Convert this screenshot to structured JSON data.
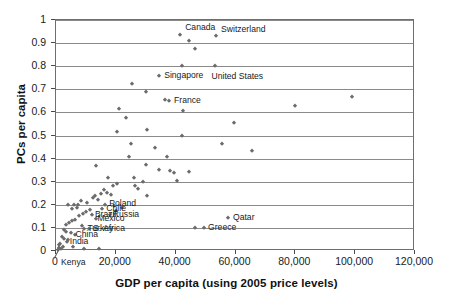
{
  "chart_data": {
    "type": "scatter",
    "title": "",
    "xlabel": "GDP per capita (using 2005 price levels)",
    "ylabel": "PCs per capita",
    "xlim": [
      0,
      120000
    ],
    "ylim": [
      0,
      1
    ],
    "xticks": [
      0,
      20000,
      40000,
      60000,
      80000,
      100000,
      120000
    ],
    "xtick_labels": [
      "0",
      "20,000",
      "40,000",
      "60,000",
      "80,000",
      "100,000",
      "120,000"
    ],
    "yticks": [
      0,
      0.1,
      0.2,
      0.3,
      0.4,
      0.5,
      0.6,
      0.7,
      0.8,
      0.9,
      1
    ],
    "ytick_labels": [
      "0",
      "0.1",
      "0.2",
      "0.3",
      "0.4",
      "0.5",
      "0.6",
      "0.7",
      "0.8",
      "0.9",
      "1"
    ],
    "grid": "horizontal",
    "legend": "none",
    "marker": "diamond",
    "marker_color": "#6b6b6b",
    "points": [
      {
        "x": 41500,
        "y": 0.935,
        "label": "Canada",
        "label_dx": 6,
        "label_dy": -7
      },
      {
        "x": 44500,
        "y": 0.91,
        "label": "",
        "label_dx": 0,
        "label_dy": 0
      },
      {
        "x": 53500,
        "y": 0.93,
        "label": "Switzerland",
        "label_dx": 6,
        "label_dy": -6
      },
      {
        "x": 46500,
        "y": 0.876,
        "label": "",
        "label_dx": 0,
        "label_dy": 0
      },
      {
        "x": 42000,
        "y": 0.8,
        "label": "",
        "label_dx": 0,
        "label_dy": 0
      },
      {
        "x": 53000,
        "y": 0.803,
        "label": "United States",
        "label_dx": -2,
        "label_dy": 7
      },
      {
        "x": 34500,
        "y": 0.757,
        "label": "Singapore",
        "label_dx": 6,
        "label_dy": 0
      },
      {
        "x": 25500,
        "y": 0.722,
        "label": "",
        "label_dx": 0,
        "label_dy": 0
      },
      {
        "x": 30000,
        "y": 0.688,
        "label": "",
        "label_dx": 0,
        "label_dy": 0
      },
      {
        "x": 36500,
        "y": 0.655,
        "label": "",
        "label_dx": 0,
        "label_dy": 0
      },
      {
        "x": 37800,
        "y": 0.648,
        "label": "France",
        "label_dx": 6,
        "label_dy": 0
      },
      {
        "x": 42500,
        "y": 0.605,
        "label": "",
        "label_dx": 0,
        "label_dy": 0
      },
      {
        "x": 21000,
        "y": 0.614,
        "label": "",
        "label_dx": 0,
        "label_dy": 0
      },
      {
        "x": 23500,
        "y": 0.577,
        "label": "",
        "label_dx": 0,
        "label_dy": 0
      },
      {
        "x": 59500,
        "y": 0.553,
        "label": "",
        "label_dx": 0,
        "label_dy": 0
      },
      {
        "x": 20500,
        "y": 0.515,
        "label": "",
        "label_dx": 0,
        "label_dy": 0
      },
      {
        "x": 30500,
        "y": 0.522,
        "label": "",
        "label_dx": 0,
        "label_dy": 0
      },
      {
        "x": 42000,
        "y": 0.498,
        "label": "",
        "label_dx": 0,
        "label_dy": 0
      },
      {
        "x": 80000,
        "y": 0.628,
        "label": "",
        "label_dx": 0,
        "label_dy": 0
      },
      {
        "x": 99000,
        "y": 0.665,
        "label": "",
        "label_dx": 0,
        "label_dy": 0
      },
      {
        "x": 25000,
        "y": 0.465,
        "label": "",
        "label_dx": 0,
        "label_dy": 0
      },
      {
        "x": 33000,
        "y": 0.448,
        "label": "",
        "label_dx": 0,
        "label_dy": 0
      },
      {
        "x": 55500,
        "y": 0.462,
        "label": "",
        "label_dx": 0,
        "label_dy": 0
      },
      {
        "x": 65500,
        "y": 0.432,
        "label": "",
        "label_dx": 0,
        "label_dy": 0
      },
      {
        "x": 24500,
        "y": 0.408,
        "label": "",
        "label_dx": 0,
        "label_dy": 0
      },
      {
        "x": 37000,
        "y": 0.408,
        "label": "",
        "label_dx": 0,
        "label_dy": 0
      },
      {
        "x": 30000,
        "y": 0.372,
        "label": "",
        "label_dx": 0,
        "label_dy": 0
      },
      {
        "x": 13500,
        "y": 0.368,
        "label": "",
        "label_dx": 0,
        "label_dy": 0
      },
      {
        "x": 34500,
        "y": 0.352,
        "label": "",
        "label_dx": 0,
        "label_dy": 0
      },
      {
        "x": 38000,
        "y": 0.345,
        "label": "",
        "label_dx": 0,
        "label_dy": 0
      },
      {
        "x": 39500,
        "y": 0.338,
        "label": "",
        "label_dx": 0,
        "label_dy": 0
      },
      {
        "x": 44500,
        "y": 0.343,
        "label": "",
        "label_dx": 0,
        "label_dy": 0
      },
      {
        "x": 40500,
        "y": 0.302,
        "label": "",
        "label_dx": 0,
        "label_dy": 0
      },
      {
        "x": 17500,
        "y": 0.318,
        "label": "",
        "label_dx": 0,
        "label_dy": 0
      },
      {
        "x": 29000,
        "y": 0.298,
        "label": "",
        "label_dx": 0,
        "label_dy": 0
      },
      {
        "x": 26500,
        "y": 0.282,
        "label": "",
        "label_dx": 0,
        "label_dy": 0
      },
      {
        "x": 27500,
        "y": 0.268,
        "label": "",
        "label_dx": 0,
        "label_dy": 0
      },
      {
        "x": 16000,
        "y": 0.262,
        "label": "",
        "label_dx": 0,
        "label_dy": 0
      },
      {
        "x": 17000,
        "y": 0.252,
        "label": "",
        "label_dx": 0,
        "label_dy": 0
      },
      {
        "x": 15000,
        "y": 0.248,
        "label": "",
        "label_dx": 0,
        "label_dy": 0
      },
      {
        "x": 18500,
        "y": 0.242,
        "label": "",
        "label_dx": 0,
        "label_dy": 0
      },
      {
        "x": 13000,
        "y": 0.238,
        "label": "",
        "label_dx": 0,
        "label_dy": 0
      },
      {
        "x": 30500,
        "y": 0.238,
        "label": "",
        "label_dx": 0,
        "label_dy": 0
      },
      {
        "x": 12500,
        "y": 0.228,
        "label": "",
        "label_dx": 0,
        "label_dy": 0
      },
      {
        "x": 14000,
        "y": 0.222,
        "label": "",
        "label_dx": 0,
        "label_dy": 0
      },
      {
        "x": 8500,
        "y": 0.215,
        "label": "",
        "label_dx": 0,
        "label_dy": 0
      },
      {
        "x": 10500,
        "y": 0.208,
        "label": "",
        "label_dx": 0,
        "label_dy": 0
      },
      {
        "x": 4000,
        "y": 0.2,
        "label": "",
        "label_dx": 0,
        "label_dy": 0
      },
      {
        "x": 6000,
        "y": 0.199,
        "label": "",
        "label_dx": 0,
        "label_dy": 0
      },
      {
        "x": 7500,
        "y": 0.197,
        "label": "",
        "label_dx": 0,
        "label_dy": 0
      },
      {
        "x": 16500,
        "y": 0.2,
        "label": "Poland",
        "label_dx": 5,
        "label_dy": -1
      },
      {
        "x": 19500,
        "y": 0.196,
        "label": "",
        "label_dx": 0,
        "label_dy": 0
      },
      {
        "x": 15500,
        "y": 0.182,
        "label": "Chile",
        "label_dx": 5,
        "label_dy": 0
      },
      {
        "x": 11500,
        "y": 0.178,
        "label": "",
        "label_dx": 0,
        "label_dy": 0
      },
      {
        "x": 10000,
        "y": 0.17,
        "label": "",
        "label_dx": 0,
        "label_dy": 0
      },
      {
        "x": 9000,
        "y": 0.162,
        "label": "",
        "label_dx": 0,
        "label_dy": 0
      },
      {
        "x": 12000,
        "y": 0.158,
        "label": "Brazil",
        "label_dx": 4,
        "label_dy": 0
      },
      {
        "x": 18000,
        "y": 0.156,
        "label": "Russia",
        "label_dx": 4,
        "label_dy": 0
      },
      {
        "x": 7800,
        "y": 0.15,
        "label": "",
        "label_dx": 0,
        "label_dy": 0
      },
      {
        "x": 13500,
        "y": 0.138,
        "label": "Mexico",
        "label_dx": 2,
        "label_dy": 0
      },
      {
        "x": 6500,
        "y": 0.136,
        "label": "",
        "label_dx": 0,
        "label_dy": 0
      },
      {
        "x": 5200,
        "y": 0.128,
        "label": "",
        "label_dx": 0,
        "label_dy": 0
      },
      {
        "x": 4200,
        "y": 0.12,
        "label": "",
        "label_dx": 0,
        "label_dy": 0
      },
      {
        "x": 3200,
        "y": 0.112,
        "label": "",
        "label_dx": 0,
        "label_dy": 0
      },
      {
        "x": 8800,
        "y": 0.108,
        "label": "",
        "label_dx": 0,
        "label_dy": 0
      },
      {
        "x": 46500,
        "y": 0.1,
        "label": "",
        "label_dx": 0,
        "label_dy": 0
      },
      {
        "x": 49500,
        "y": 0.098,
        "label": "Greece",
        "label_dx": 5,
        "label_dy": 0
      },
      {
        "x": 9500,
        "y": 0.096,
        "label": "Turkey",
        "label_dx": 0,
        "label_dy": 0
      },
      {
        "x": 11000,
        "y": 0.094,
        "label": "S. Africa",
        "label_dx": 5,
        "label_dy": 0
      },
      {
        "x": 2600,
        "y": 0.09,
        "label": "",
        "label_dx": 0,
        "label_dy": 0
      },
      {
        "x": 3400,
        "y": 0.082,
        "label": "",
        "label_dx": 0,
        "label_dy": 0
      },
      {
        "x": 5000,
        "y": 0.076,
        "label": "",
        "label_dx": 0,
        "label_dy": 0
      },
      {
        "x": 6200,
        "y": 0.068,
        "label": "China",
        "label_dx": 2,
        "label_dy": 0
      },
      {
        "x": 2000,
        "y": 0.06,
        "label": "",
        "label_dx": 0,
        "label_dy": 0
      },
      {
        "x": 2800,
        "y": 0.052,
        "label": "",
        "label_dx": 0,
        "label_dy": 0
      },
      {
        "x": 4000,
        "y": 0.046,
        "label": "",
        "label_dx": 0,
        "label_dy": 0
      },
      {
        "x": 3600,
        "y": 0.038,
        "label": "India",
        "label_dx": 0,
        "label_dy": 0
      },
      {
        "x": 1500,
        "y": 0.032,
        "label": "",
        "label_dx": 0,
        "label_dy": 0
      },
      {
        "x": 1000,
        "y": 0.024,
        "label": "",
        "label_dx": 0,
        "label_dy": 0
      },
      {
        "x": 2200,
        "y": 0.018,
        "label": "",
        "label_dx": 0,
        "label_dy": 0
      },
      {
        "x": 5800,
        "y": 0.016,
        "label": "",
        "label_dx": 0,
        "label_dy": 0
      },
      {
        "x": 900,
        "y": 0.012,
        "label": "",
        "label_dx": 0,
        "label_dy": 0
      },
      {
        "x": 1600,
        "y": 0.008,
        "label": "",
        "label_dx": 0,
        "label_dy": 0
      },
      {
        "x": 9500,
        "y": 0.01,
        "label": "",
        "label_dx": 0,
        "label_dy": 0
      },
      {
        "x": 14500,
        "y": 0.01,
        "label": "",
        "label_dx": 0,
        "label_dy": 0
      },
      {
        "x": 700,
        "y": 0.004,
        "label": "Kenya",
        "label_dx": 0,
        "label_dy": 0
      },
      {
        "x": 57500,
        "y": 0.142,
        "label": "Qatar",
        "label_dx": 6,
        "label_dy": 0
      },
      {
        "x": 22000,
        "y": 0.188,
        "label": "",
        "label_dx": 0,
        "label_dy": 0
      },
      {
        "x": 20000,
        "y": 0.172,
        "label": "",
        "label_dx": 0,
        "label_dy": 0
      },
      {
        "x": 7000,
        "y": 0.188,
        "label": "",
        "label_dx": 0,
        "label_dy": 0
      },
      {
        "x": 5500,
        "y": 0.182,
        "label": "",
        "label_dx": 0,
        "label_dy": 0
      },
      {
        "x": 19000,
        "y": 0.282,
        "label": "",
        "label_dx": 0,
        "label_dy": 0
      },
      {
        "x": 20500,
        "y": 0.292,
        "label": "",
        "label_dx": 0,
        "label_dy": 0
      },
      {
        "x": 26000,
        "y": 0.318,
        "label": "",
        "label_dx": 0,
        "label_dy": 0
      }
    ],
    "annotated_labels": [
      "Canada",
      "Switzerland",
      "United States",
      "Singapore",
      "France",
      "Qatar",
      "Greece",
      "Poland",
      "Chile",
      "Brazil",
      "Russia",
      "Mexico",
      "Turkey",
      "S. Africa",
      "China",
      "India",
      "Kenya"
    ]
  }
}
